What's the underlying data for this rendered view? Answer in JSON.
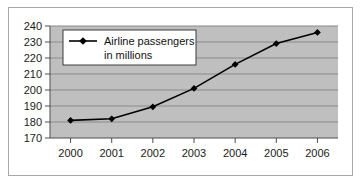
{
  "chart_data": {
    "type": "line",
    "title": "",
    "xlabel": "",
    "ylabel": "",
    "categories": [
      "2000",
      "2001",
      "2002",
      "2003",
      "2004",
      "2005",
      "2006"
    ],
    "x": [
      2000,
      2001,
      2002,
      2003,
      2004,
      2005,
      2006
    ],
    "series": [
      {
        "name": "Airline passengers in millions",
        "values": [
          181,
          182,
          189.5,
          201,
          216,
          229,
          236
        ],
        "marker": "diamond",
        "color": "#000000"
      }
    ],
    "ylim": [
      170,
      240
    ],
    "ytick_labels": [
      "170",
      "180",
      "190",
      "200",
      "210",
      "220",
      "230",
      "240"
    ],
    "ytick_values": [
      170,
      180,
      190,
      200,
      210,
      220,
      230,
      240
    ],
    "xtick_labels": [
      "2000",
      "2001",
      "2002",
      "2003",
      "2004",
      "2005",
      "2006"
    ],
    "grid": true,
    "grid_axis": "y",
    "legend_position": "upper-left-inside",
    "legend_entries": [
      {
        "label_line1": "Airline passengers",
        "label_line2": "in millions"
      }
    ],
    "colors": {
      "plot_background": "#bfbfbf",
      "gridline": "#8a8a8a",
      "axis": "#4d4d4d",
      "series": "#000000",
      "legend_background": "#ffffff",
      "legend_border": "#3c3c3c",
      "frame_border": "#a8a8a8",
      "page_background": "#ffffff",
      "tick_text": "#1a1a1a"
    }
  }
}
